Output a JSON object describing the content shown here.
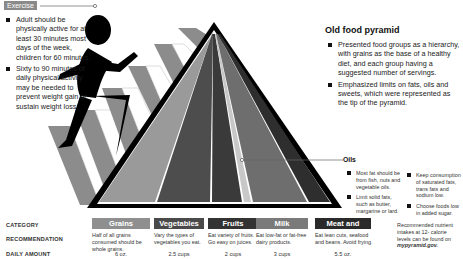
{
  "exercise": {
    "tag": "Exercise",
    "bullets": [
      "Adult should be physically active for at least 30 minutes most days of the week, children for 60 minutes.",
      "Sixty to 90 minutes of daily physical activity may be needed to prevent weight gain or sustain weight loss."
    ]
  },
  "old_pyramid": {
    "title": "Old food pyramid",
    "bullets": [
      "Presented food groups as a hierarchy, with grains as the base of a healthy diet, and each group having a suggested number of servings.",
      "Emphasized limits on fats, oils and sweets, which were represented as the tip of the pyramid."
    ]
  },
  "oils": {
    "label": "Oils",
    "col1": [
      "Most fat should be from fish, nuts and vegetable oils.",
      "Limit solid fats, such as butter, margarine or lard."
    ],
    "col2": [
      "Keep consumption of saturated fats, trans fats and sodium low.",
      "Choose foods low in added sugar."
    ]
  },
  "table": {
    "row_labels": {
      "category": "CATEGORY",
      "recommendation": "RECOMMENDATION",
      "daily_amount": "DAILY AMOUNT"
    },
    "columns": [
      {
        "category": "Grains",
        "recommendation": "Half of all grains consumed should be whole grains.",
        "amount": "6 oz.",
        "color": "#8f8f8f"
      },
      {
        "category": "Vegetables",
        "recommendation": "Vary the types of vegetables you eat.",
        "amount": "2.5 cups",
        "color": "#4a4a4a"
      },
      {
        "category": "Fruits",
        "recommendation": "Eat variety of fruits. Go easy on juices.",
        "amount": "2 cups",
        "color": "#333333"
      },
      {
        "category": "Milk",
        "recommendation": "Eat low-fat or fat-free dairy products.",
        "amount": "3 cups",
        "color": "#7a7a7a"
      },
      {
        "category": "Meat and beans",
        "recommendation": "Eat lean cuts, seafood and beans. Avoid frying.",
        "amount": "5.5 oz.",
        "color": "#2a2a2a"
      }
    ],
    "note": "Recommended nutrient intakes at 12- calorie levels can be found on",
    "note_link": "mypyramid.gov."
  },
  "colors": {
    "grains": "#9a9a9a",
    "vegetables": "#4d4d4d",
    "fruits": "#3a3a3a",
    "oils": "#c8c8c8",
    "milk": "#6e6e6e",
    "meat": "#2e2e2e",
    "stairs": "#8c8c8c"
  }
}
